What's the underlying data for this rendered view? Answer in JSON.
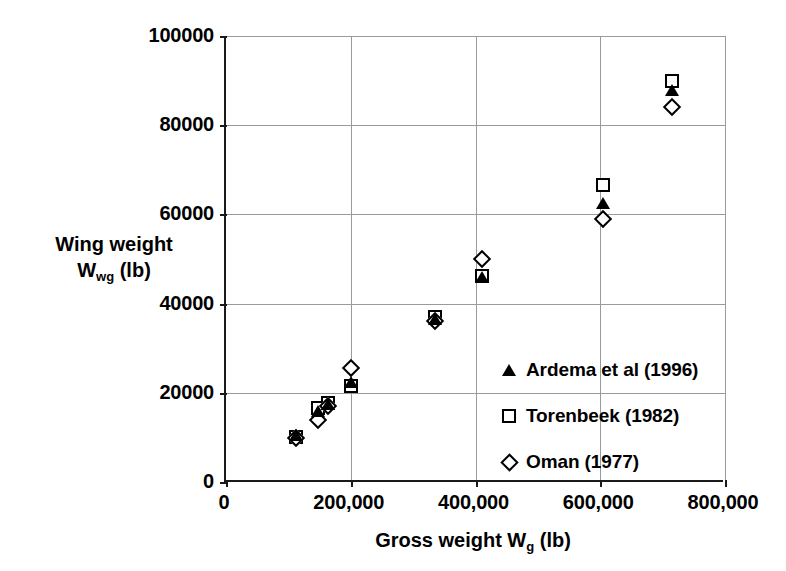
{
  "chart_data": {
    "type": "scatter",
    "title": "",
    "xlabel": "Gross weight Wg (lb)",
    "ylabel": "Wing weight Wwg (lb)",
    "xlim": [
      0,
      800000
    ],
    "ylim": [
      0,
      100000
    ],
    "grid": true,
    "legend_position": "inside-lower-right",
    "x_ticks": [
      "0",
      "200,000",
      "400,000",
      "600,000",
      "800,000"
    ],
    "x_tick_values": [
      0,
      200000,
      400000,
      600000,
      800000
    ],
    "y_ticks": [
      "0",
      "20000",
      "40000",
      "60000",
      "80000",
      "100000"
    ],
    "y_tick_values": [
      0,
      20000,
      40000,
      60000,
      80000,
      100000
    ],
    "series": [
      {
        "name": "Ardema et al (1996)",
        "marker": "filled-triangle",
        "color": "#000000",
        "points": [
          {
            "x": 112000,
            "y": 10500
          },
          {
            "x": 148000,
            "y": 16000
          },
          {
            "x": 163000,
            "y": 17500
          },
          {
            "x": 200000,
            "y": 22500
          },
          {
            "x": 335000,
            "y": 36500
          },
          {
            "x": 410000,
            "y": 46000
          },
          {
            "x": 605000,
            "y": 62500
          },
          {
            "x": 715000,
            "y": 87800
          }
        ]
      },
      {
        "name": "Torenbeek (1982)",
        "marker": "open-square",
        "color": "#000000",
        "points": [
          {
            "x": 112000,
            "y": 10200
          },
          {
            "x": 148000,
            "y": 16500
          },
          {
            "x": 163000,
            "y": 17800
          },
          {
            "x": 200000,
            "y": 21500
          },
          {
            "x": 335000,
            "y": 37000
          },
          {
            "x": 410000,
            "y": 46300
          },
          {
            "x": 605000,
            "y": 66500
          },
          {
            "x": 715000,
            "y": 90000
          }
        ]
      },
      {
        "name": "Oman (1977)",
        "marker": "open-diamond",
        "color": "#000000",
        "points": [
          {
            "x": 112000,
            "y": 9800
          },
          {
            "x": 148000,
            "y": 14000
          },
          {
            "x": 163000,
            "y": 17000
          },
          {
            "x": 200000,
            "y": 25500
          },
          {
            "x": 335000,
            "y": 36200
          },
          {
            "x": 410000,
            "y": 50000
          },
          {
            "x": 605000,
            "y": 59000
          },
          {
            "x": 715000,
            "y": 84000
          }
        ]
      }
    ]
  },
  "axis_titles": {
    "y_line1": "Wing weight",
    "y_main": "W",
    "y_sub": "wg",
    "y_unit": " (lb)",
    "x_main": "Gross weight W",
    "x_sub": "g",
    "x_unit": " (lb)"
  },
  "legend": {
    "items": [
      {
        "label": "Ardema et al (1996)",
        "marker": "filled-triangle"
      },
      {
        "label": "Torenbeek (1982)",
        "marker": "open-square"
      },
      {
        "label": "Oman (1977)",
        "marker": "open-diamond"
      }
    ]
  }
}
